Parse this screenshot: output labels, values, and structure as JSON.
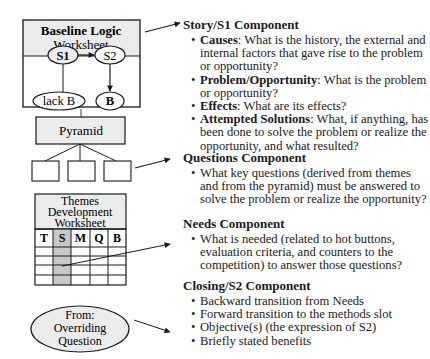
{
  "diagram": {
    "baseline_worksheet": {
      "title_line1": "Baseline Logic",
      "title_line2": "Worksheet",
      "nodes": {
        "s1": "S1",
        "s2": "S2",
        "lack_b": "lack B",
        "b": "B"
      }
    },
    "pyramid": {
      "label": "Pyramid"
    },
    "themes_worksheet": {
      "title_line1": "Themes",
      "title_line2": "Development",
      "title_line3": "Worksheet",
      "columns": [
        "T",
        "S",
        "M",
        "Q",
        "B"
      ],
      "highlighted_column": "S"
    },
    "overriding_question": {
      "line1": "From:",
      "line2": "Overriding",
      "line3": "Question"
    },
    "colors": {
      "box_fill": "#ececec",
      "highlight_fill": "#c8c8c8",
      "stroke": "#1a1a1a"
    }
  },
  "sections": [
    {
      "title": "Story/S1 Component",
      "bullets": [
        {
          "term": "Causes",
          "text": ": What is the history, the external and internal factors that gave rise to the problem or opportunity?"
        },
        {
          "term": "Problem/Opportunity",
          "text": ": What is the problem or opportunity?"
        },
        {
          "term": "Effects",
          "text": ": What are its effects?"
        },
        {
          "term": "Attempted Solutions",
          "text": ": What, if anything, has been done to solve the problem or realize the opportunity, and what resulted?"
        }
      ]
    },
    {
      "title": "Questions Component",
      "bullets": [
        {
          "term": "",
          "text": "What key questions (derived from themes and from the pyramid) must be answered to solve the problem or realize the opportunity?"
        }
      ]
    },
    {
      "title": "Needs Component",
      "bullets": [
        {
          "term": "",
          "text": "What is needed (related to hot buttons, evaluation criteria, and counters to the competition) to answer those questions?"
        }
      ]
    },
    {
      "title": "Closing/S2 Component",
      "bullets": [
        {
          "term": "",
          "text": "Backward transition from Needs"
        },
        {
          "term": "",
          "text": "Forward transition to the methods slot"
        },
        {
          "term": "",
          "text": "Objective(s) (the expression of S2)"
        },
        {
          "term": "",
          "text": "Briefly stated benefits"
        }
      ]
    }
  ]
}
